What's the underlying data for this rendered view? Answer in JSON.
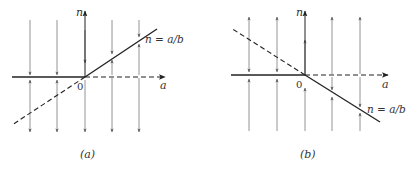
{
  "panels": [
    {
      "id": "a",
      "caption": "(a)",
      "axis_x_label": "a",
      "axis_y_label": "n",
      "origin_label": "0",
      "line_label": "n = a/b",
      "description": "Solid line n=a/b rising for a>0; dashed extension for a<0. Solid n=0 for a<0, dashed n=0 for a>0. Flow arrows point toward the stable solid branches."
    },
    {
      "id": "b",
      "caption": "(b)",
      "axis_x_label": "a",
      "axis_y_label": "n",
      "origin_label": "0",
      "line_label": "n = a/b",
      "description": "Solid line n=a/b falling for a>0; dashed extension for a<0. Solid n=0 for a<0, dashed n=0 for a>0. Flow arrows point toward the stable solid branches."
    }
  ],
  "colors": {
    "ink": "#333333",
    "arrow": "#777777"
  }
}
